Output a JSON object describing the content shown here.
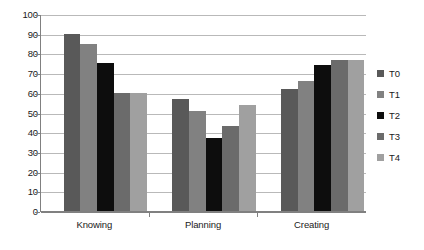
{
  "chart_data": {
    "type": "bar",
    "title": "",
    "xlabel": "",
    "ylabel": "",
    "ylim": [
      0,
      100
    ],
    "ytick_step": 10,
    "yticks": [
      100,
      90,
      80,
      70,
      60,
      50,
      40,
      30,
      20,
      10,
      0
    ],
    "grid": true,
    "legend_position": "right",
    "categories": [
      "Knowing",
      "Planning",
      "Creating"
    ],
    "series": [
      {
        "name": "T0",
        "color": "#595959",
        "values": [
          90,
          57,
          62
        ]
      },
      {
        "name": "T1",
        "color": "#818181",
        "values": [
          85,
          51,
          66
        ]
      },
      {
        "name": "T2",
        "color": "#0d0d0d",
        "values": [
          75,
          37,
          74
        ]
      },
      {
        "name": "T3",
        "color": "#6b6b6b",
        "values": [
          60,
          43,
          76.5
        ]
      },
      {
        "name": "T4",
        "color": "#a0a0a0",
        "values": [
          60,
          54,
          76.5
        ]
      }
    ]
  },
  "legend": {
    "items": [
      {
        "label": "T0"
      },
      {
        "label": "T1"
      },
      {
        "label": "T2"
      },
      {
        "label": "T3"
      },
      {
        "label": "T4"
      }
    ]
  },
  "axis": {
    "y_labels": [
      "100",
      "90",
      "80",
      "70",
      "60",
      "50",
      "40",
      "30",
      "20",
      "10",
      "0"
    ],
    "x_labels": [
      "Knowing",
      "Planning",
      "Creating"
    ]
  },
  "colors": {
    "grid": "#b9b9b9",
    "axis": "#808080",
    "text": "#1a1a1a",
    "background": "#ffffff"
  }
}
